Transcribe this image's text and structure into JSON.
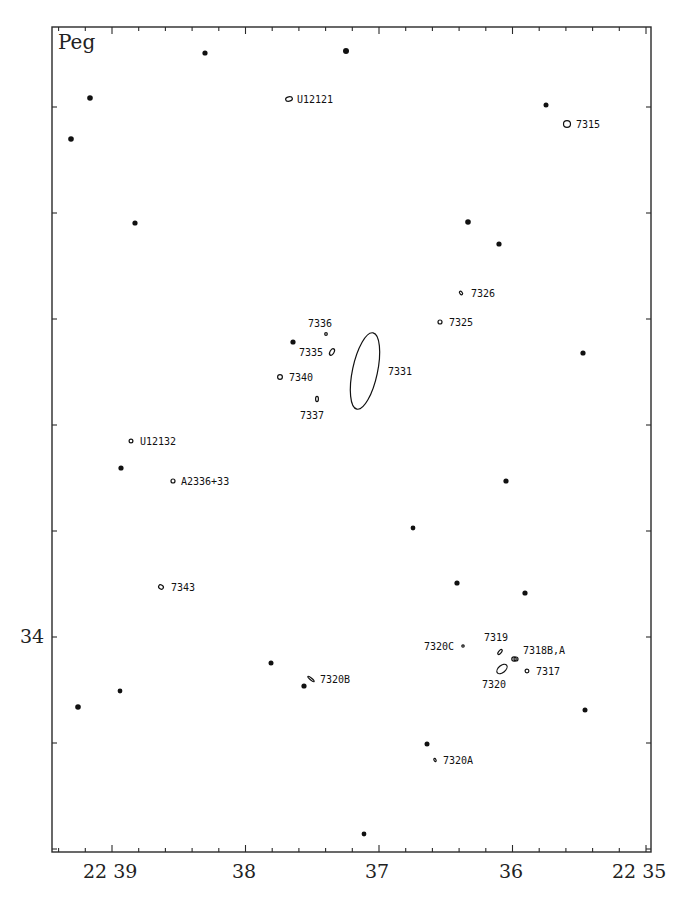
{
  "chart_data": {
    "type": "scatter",
    "title": "Peg",
    "constellation_label": "Peg",
    "xlabel": "Right Ascension (22h, minutes)",
    "ylabel": "Declination (deg)",
    "x_axis": {
      "direction": "decreasing",
      "range_min": [
        39.45,
        34.95
      ],
      "tick_labels": [
        {
          "text": "22 39",
          "value": 39
        },
        {
          "text": "38",
          "value": 38
        },
        {
          "text": "37",
          "value": 37
        },
        {
          "text": "36",
          "value": 36
        },
        {
          "text": "22 35",
          "value": 35
        }
      ],
      "minor_ticks_per_major": 5
    },
    "y_axis": {
      "tick_labels": [
        {
          "text": "34",
          "value": 34
        }
      ],
      "major_tick_spacing_px": 106,
      "approx_range_deg": [
        33.0,
        35.3
      ]
    },
    "grid": false,
    "frame": {
      "left": 52,
      "top": 27,
      "right": 651,
      "bottom": 852
    },
    "stars": [
      {
        "x": 205,
        "y": 53,
        "r": 2.6
      },
      {
        "x": 346,
        "y": 51,
        "r": 3.0
      },
      {
        "x": 90,
        "y": 98,
        "r": 2.8
      },
      {
        "x": 546,
        "y": 105,
        "r": 2.5
      },
      {
        "x": 71,
        "y": 139,
        "r": 2.8
      },
      {
        "x": 135,
        "y": 223,
        "r": 2.6
      },
      {
        "x": 468,
        "y": 222,
        "r": 2.8
      },
      {
        "x": 499,
        "y": 244,
        "r": 2.6
      },
      {
        "x": 293,
        "y": 342,
        "r": 2.6
      },
      {
        "x": 583,
        "y": 353,
        "r": 2.6
      },
      {
        "x": 121,
        "y": 468,
        "r": 2.6
      },
      {
        "x": 506,
        "y": 481,
        "r": 2.6
      },
      {
        "x": 413,
        "y": 528,
        "r": 2.4
      },
      {
        "x": 457,
        "y": 583,
        "r": 2.6
      },
      {
        "x": 525,
        "y": 593,
        "r": 2.6
      },
      {
        "x": 271,
        "y": 663,
        "r": 2.5
      },
      {
        "x": 120,
        "y": 691,
        "r": 2.4
      },
      {
        "x": 304,
        "y": 686,
        "r": 2.6
      },
      {
        "x": 78,
        "y": 707,
        "r": 2.8
      },
      {
        "x": 585,
        "y": 710,
        "r": 2.5
      },
      {
        "x": 427,
        "y": 744,
        "r": 2.5
      },
      {
        "x": 364,
        "y": 834,
        "r": 2.4
      }
    ],
    "galaxies": [
      {
        "name": "U12121",
        "x": 289,
        "y": 99,
        "rx": 3.4,
        "ry": 2.2,
        "angle": -10,
        "lx": 297,
        "ly": 103
      },
      {
        "name": "7315",
        "x": 567,
        "y": 124,
        "rx": 3.5,
        "ry": 3.3,
        "angle": 0,
        "lx": 576,
        "ly": 128
      },
      {
        "name": "7326",
        "x": 461,
        "y": 293,
        "rx": 2.0,
        "ry": 1.2,
        "angle": 50,
        "lx": 471,
        "ly": 297
      },
      {
        "name": "7325",
        "x": 440,
        "y": 322,
        "rx": 2.0,
        "ry": 2.0,
        "angle": 0,
        "lx": 449,
        "ly": 326
      },
      {
        "name": "7336",
        "x": 326,
        "y": 334,
        "rx": 1.3,
        "ry": 1.3,
        "angle": 0,
        "lx": 308,
        "ly": 327
      },
      {
        "name": "7335",
        "x": 332,
        "y": 352,
        "rx": 2.0,
        "ry": 3.6,
        "angle": 30,
        "lx": 299,
        "ly": 356
      },
      {
        "name": "7331",
        "x": 365,
        "y": 371,
        "rx": 12.5,
        "ry": 39,
        "angle": 12,
        "lx": 388,
        "ly": 375
      },
      {
        "name": "7340",
        "x": 280,
        "y": 377,
        "rx": 2.4,
        "ry": 2.4,
        "angle": 0,
        "lx": 289,
        "ly": 381
      },
      {
        "name": "7337",
        "x": 317,
        "y": 399,
        "rx": 1.4,
        "ry": 2.6,
        "angle": 0,
        "lx": 300,
        "ly": 419
      },
      {
        "name": "U12132",
        "x": 131,
        "y": 441,
        "rx": 1.9,
        "ry": 1.9,
        "angle": 0,
        "lx": 140,
        "ly": 445
      },
      {
        "name": "A2336+33",
        "x": 173,
        "y": 481,
        "rx": 2.0,
        "ry": 2.0,
        "angle": 0,
        "lx": 181,
        "ly": 485
      },
      {
        "name": "7343",
        "x": 161,
        "y": 587,
        "rx": 2.5,
        "ry": 2.0,
        "angle": 30,
        "lx": 171,
        "ly": 591
      },
      {
        "name": "7320C",
        "x": 463,
        "y": 646,
        "rx": 1.2,
        "ry": 1.2,
        "angle": 0,
        "lx": 424,
        "ly": 650
      },
      {
        "name": "7319",
        "x": 500,
        "y": 652,
        "rx": 1.3,
        "ry": 3.0,
        "angle": 40,
        "lx": 484,
        "ly": 641
      },
      {
        "name": "7318B,A",
        "x": 514,
        "y": 659,
        "rx": 2.2,
        "ry": 2.2,
        "angle": 0,
        "lx": 523,
        "ly": 654
      },
      {
        "name": "7320",
        "x": 502,
        "y": 669,
        "rx": 3.5,
        "ry": 6.0,
        "angle": 50,
        "lx": 482,
        "ly": 688
      },
      {
        "name": "7317",
        "x": 527,
        "y": 671,
        "rx": 1.9,
        "ry": 1.9,
        "angle": 0,
        "lx": 536,
        "ly": 675
      },
      {
        "name": "7320B",
        "x": 311,
        "y": 679,
        "rx": 1.0,
        "ry": 4.0,
        "angle": -50,
        "lx": 320,
        "ly": 683
      },
      {
        "name": "7320A",
        "x": 435,
        "y": 760,
        "rx": 1.0,
        "ry": 1.6,
        "angle": -30,
        "lx": 443,
        "ly": 764
      }
    ],
    "extra_galaxy_points": [
      {
        "x": 516,
        "y": 659,
        "rx": 2.0,
        "ry": 2.0,
        "angle": 0
      }
    ]
  },
  "labels": {
    "constellation": "Peg",
    "x_tick_22_39": "22 39",
    "x_tick_38": "38",
    "x_tick_37": "37",
    "x_tick_36": "36",
    "x_tick_22_35": "22 35",
    "y_tick_34": "34"
  }
}
